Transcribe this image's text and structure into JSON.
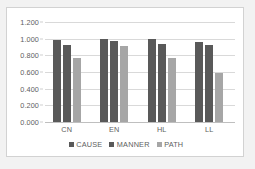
{
  "chart_data": {
    "type": "bar",
    "title": "",
    "xlabel": "",
    "ylabel": "",
    "categories": [
      "CN",
      "EN",
      "HL",
      "LL"
    ],
    "series": [
      {
        "name": "CAUSE",
        "color": "#595959",
        "values": [
          0.99,
          1.0,
          1.0,
          0.96
        ]
      },
      {
        "name": "MANNER",
        "color": "#595959",
        "values": [
          0.92,
          0.97,
          0.94,
          0.92
        ]
      },
      {
        "name": "PATH",
        "color": "#a6a6a6",
        "values": [
          0.77,
          0.91,
          0.77,
          0.59
        ]
      }
    ],
    "ylim": [
      0.0,
      1.2
    ],
    "ytick_step": 0.2,
    "ytick_labels": [
      "0.000",
      "0.200",
      "0.400",
      "0.600",
      "0.800",
      "1.000",
      "1.200"
    ],
    "ytick_values": [
      0.0,
      0.2,
      0.4,
      0.6,
      0.8,
      1.0,
      1.2
    ],
    "grid": true,
    "legend_position": "bottom",
    "legend": [
      "CAUSE",
      "MANNER",
      "PATH"
    ]
  },
  "figure": {
    "background_color": "#f2f2f2",
    "plot_background_color": "#ffffff",
    "border_color": "#d2d2d2",
    "gridline_color": "#d9d9d9",
    "text_color": "#5e5e5e"
  }
}
